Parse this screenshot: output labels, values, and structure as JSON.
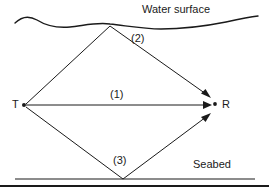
{
  "figure": {
    "title": "",
    "labels": {
      "water_surface": "Water surface",
      "seabed": "Seabed",
      "transmitter": "T",
      "receiver": "R",
      "path_direct": "(1)",
      "path_surface": "(2)",
      "path_bottom": "(3)"
    },
    "colors": {
      "line": "#1a1a1a",
      "background": "#ffffff",
      "text": "#1a1a1a"
    },
    "geometry": {
      "transmitter_point": [
        24,
        105
      ],
      "receiver_point": [
        215,
        105
      ],
      "surface_bounce_point": [
        110,
        26
      ],
      "bottom_bounce_point": [
        123,
        179
      ],
      "direct_arrow_tip": [
        211,
        105
      ],
      "surface_arrow_tip": [
        208,
        96
      ],
      "bottom_arrow_tip": [
        209,
        114
      ],
      "seabed_line_y": 179,
      "seabed_line_span": [
        15,
        255
      ],
      "frame_bottom_y": 186
    }
  }
}
